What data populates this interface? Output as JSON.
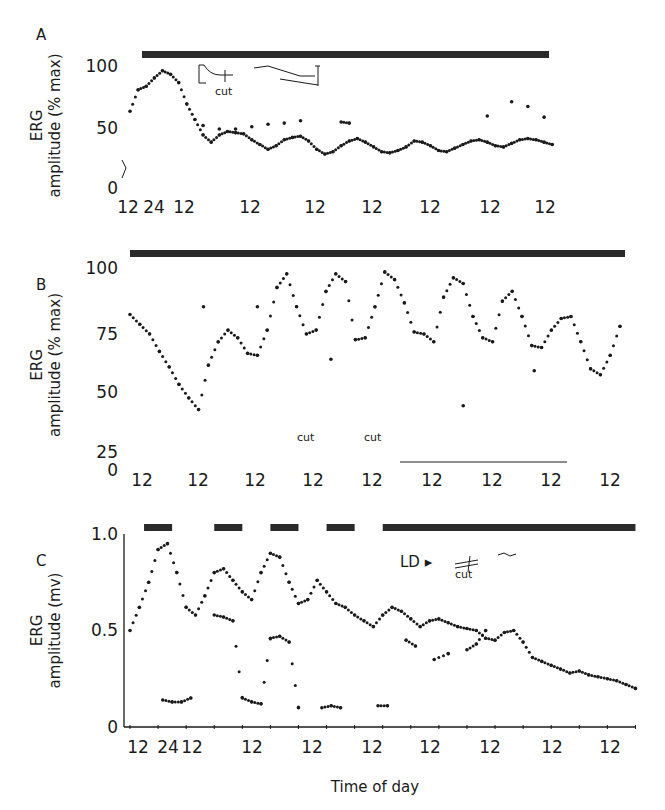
{
  "figure": {
    "xlabel": "Time of day",
    "colors": {
      "ink": "#1a1a1a",
      "bar": "#2a2a2a",
      "background": "#ffffff"
    }
  },
  "chart_data": [
    {
      "panel": "A",
      "type": "scatter",
      "title": "",
      "xlabel": "",
      "ylabel": "ERG amplitude (% max)",
      "ylim": [
        0,
        100
      ],
      "yticks": [
        "0",
        "50",
        "100"
      ],
      "xtick_labels": [
        "12",
        "24",
        "12",
        "12",
        "12",
        "12",
        "12",
        "12",
        "12"
      ],
      "x_unit": "hours from first noon",
      "grid": false,
      "light_bar": {
        "segments": [
          [
            0,
            210
          ]
        ],
        "description": "continuous dark bar (constant darkness)"
      },
      "annotations": [
        "cut"
      ],
      "series": [
        {
          "name": "lower trace",
          "x": [
            0,
            4,
            8,
            12,
            16,
            20,
            24,
            28,
            32,
            36,
            40,
            44,
            48,
            52,
            56,
            60,
            64,
            68,
            72,
            76,
            80,
            84,
            88,
            92,
            96,
            100,
            104,
            108,
            112,
            116,
            120,
            124,
            128,
            132,
            136,
            140,
            144,
            148,
            152,
            156,
            160,
            164,
            168,
            172,
            176,
            180,
            184,
            188,
            192,
            196,
            200,
            204,
            208
          ],
          "values": [
            62,
            80,
            83,
            90,
            96,
            93,
            86,
            68,
            55,
            42,
            36,
            42,
            45,
            44,
            43,
            38,
            34,
            30,
            33,
            38,
            40,
            41,
            37,
            30,
            26,
            28,
            33,
            37,
            39,
            36,
            32,
            28,
            27,
            29,
            32,
            37,
            36,
            33,
            29,
            28,
            31,
            34,
            37,
            38,
            36,
            33,
            32,
            35,
            38,
            39,
            38,
            36,
            34
          ]
        },
        {
          "name": "upper trace",
          "x": [
            36,
            44,
            52,
            60,
            68,
            76,
            84,
            104,
            108,
            176,
            188,
            196,
            204
          ],
          "values": [
            50,
            47,
            47,
            49,
            51,
            52,
            54,
            53,
            52,
            58,
            70,
            66,
            57
          ]
        }
      ]
    },
    {
      "panel": "B",
      "type": "scatter",
      "ylabel": "ERG amplitude (% max)",
      "ylim": [
        0,
        100
      ],
      "yticks": [
        "0",
        "25",
        "50",
        "75",
        "100"
      ],
      "xtick_labels": [
        "12",
        "12",
        "12",
        "12",
        "12",
        "12",
        "12",
        "12",
        "12"
      ],
      "x_unit": "hours from first noon",
      "grid": false,
      "light_bar": {
        "segments": [
          [
            0,
            200
          ]
        ],
        "description": "continuous dark bar (constant darkness)"
      },
      "annotations": [
        "cut",
        "cut"
      ],
      "series": [
        {
          "name": "rhythm",
          "x": [
            0,
            4,
            8,
            12,
            16,
            20,
            24,
            28,
            32,
            36,
            40,
            44,
            48,
            52,
            56,
            60,
            64,
            68,
            72,
            76,
            80,
            84,
            88,
            92,
            96,
            100,
            104,
            108,
            112,
            116,
            120,
            124,
            128,
            132,
            136,
            140,
            144,
            148,
            152,
            156,
            160,
            164,
            168,
            172,
            176,
            180,
            184,
            188,
            192,
            196,
            200
          ],
          "values": [
            76,
            71,
            66,
            57,
            49,
            40,
            33,
            27,
            50,
            62,
            68,
            64,
            56,
            55,
            68,
            90,
            97,
            80,
            66,
            68,
            88,
            97,
            93,
            63,
            64,
            80,
            98,
            94,
            82,
            67,
            66,
            62,
            85,
            95,
            92,
            75,
            64,
            62,
            83,
            88,
            75,
            60,
            59,
            68,
            74,
            75,
            62,
            48,
            45,
            55,
            70
          ]
        },
        {
          "name": "isolated points",
          "x": [
            30,
            52,
            82,
            136,
            165
          ],
          "values": [
            80,
            80,
            53,
            29,
            47
          ]
        }
      ]
    },
    {
      "panel": "C",
      "type": "scatter",
      "ylabel": "ERG amplitude (mv)",
      "ylim": [
        0,
        1.0
      ],
      "yticks": [
        "0",
        "0.5",
        "1.0"
      ],
      "xtick_labels": [
        "12",
        "24",
        "12",
        "12",
        "12",
        "12",
        "12",
        "12",
        "12",
        "12"
      ],
      "x_unit": "hours from first noon",
      "grid": false,
      "light_bar": {
        "segments": [
          [
            6,
            18
          ],
          [
            36,
            48
          ],
          [
            60,
            72
          ],
          [
            84,
            96
          ],
          [
            108,
            216
          ]
        ],
        "description": "dark periods (LD cycles then constant darkness)"
      },
      "annotations": [
        "LD ▸",
        "cut"
      ],
      "series": [
        {
          "name": "upper trace",
          "x": [
            0,
            4,
            8,
            12,
            16,
            20,
            24,
            28,
            32,
            36,
            40,
            44,
            48,
            52,
            56,
            60,
            64,
            68,
            72,
            76,
            80,
            84,
            88,
            92,
            96,
            100,
            104,
            108,
            112,
            116,
            120,
            124,
            128,
            132,
            136,
            140,
            144,
            148,
            152,
            156,
            160,
            164,
            168,
            172,
            176,
            180,
            184,
            188,
            192,
            196,
            200,
            204,
            208,
            212,
            216
          ],
          "values": [
            0.5,
            0.62,
            0.75,
            0.92,
            0.95,
            0.8,
            0.62,
            0.58,
            0.68,
            0.8,
            0.82,
            0.76,
            0.7,
            0.66,
            0.8,
            0.9,
            0.88,
            0.75,
            0.64,
            0.66,
            0.76,
            0.7,
            0.64,
            0.62,
            0.58,
            0.55,
            0.52,
            0.58,
            0.62,
            0.6,
            0.56,
            0.52,
            0.55,
            0.56,
            0.54,
            0.52,
            0.51,
            0.5,
            0.46,
            0.45,
            0.49,
            0.5,
            0.44,
            0.36,
            0.34,
            0.32,
            0.3,
            0.28,
            0.29,
            0.27,
            0.26,
            0.25,
            0.24,
            0.22,
            0.2
          ]
        },
        {
          "name": "lower trace",
          "x": [
            14,
            18,
            22,
            26,
            36,
            40,
            44,
            48,
            52,
            56,
            60,
            64,
            68,
            72,
            82,
            86,
            90,
            106,
            110,
            118,
            122,
            130,
            136,
            144,
            148,
            152
          ],
          "values": [
            0.14,
            0.13,
            0.13,
            0.15,
            0.58,
            0.57,
            0.55,
            0.15,
            0.13,
            0.12,
            0.46,
            0.47,
            0.44,
            0.1,
            0.1,
            0.11,
            0.1,
            0.11,
            0.11,
            0.45,
            0.42,
            0.35,
            0.38,
            0.4,
            0.43,
            0.5
          ]
        }
      ]
    }
  ]
}
